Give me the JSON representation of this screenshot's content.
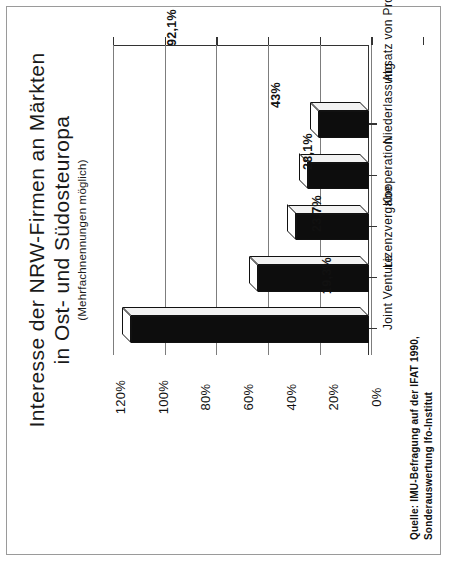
{
  "page": {
    "border_color": "#9a9a9a",
    "background": "#ffffff"
  },
  "title": {
    "line1": "Interesse der NRW-Firmen an Märkten",
    "line2": "in Ost- und Südosteuropa",
    "subtitle": "(Mehrfachnennungen möglich)"
  },
  "source": {
    "line1": "Quelle: IMU-Befragung auf der IFAT 1990,",
    "line2": "Sonderauswertung  Ifo-Institut"
  },
  "axis": {
    "ticks": [
      "0%",
      "20%",
      "40%",
      "60%",
      "80%",
      "100%",
      "120%"
    ]
  },
  "chart_data": {
    "type": "bar",
    "orientation": "vertical-rotated",
    "title": "Interesse der NRW-Firmen an Märkten in Ost- und Südosteuropa",
    "subtitle": "(Mehrfachnennungen möglich)",
    "xlabel": "",
    "ylabel": "",
    "ylim": [
      0,
      120
    ],
    "ytick_labels": [
      "0%",
      "20%",
      "40%",
      "60%",
      "80%",
      "100%",
      "120%"
    ],
    "ytick_values": [
      0,
      20,
      40,
      60,
      80,
      100,
      120
    ],
    "grid": true,
    "legend": false,
    "categories": [
      "Absatz von Produkten",
      "Niederlassung",
      "Kooperation",
      "Lizenzvergabe",
      "Joint Venture"
    ],
    "values": [
      92.1,
      43,
      28.1,
      23.7,
      19.3
    ],
    "value_labels": [
      "92,1%",
      "43%",
      "28,1%",
      "23,7%",
      "19,3%"
    ],
    "bar_color": "#0d0d0d",
    "bar_top_color": "#ffffff",
    "bar_side_color": "#f2f2f2",
    "note": "Quelle: IMU-Befragung auf der IFAT 1990, Sonderauswertung Ifo-Institut"
  }
}
